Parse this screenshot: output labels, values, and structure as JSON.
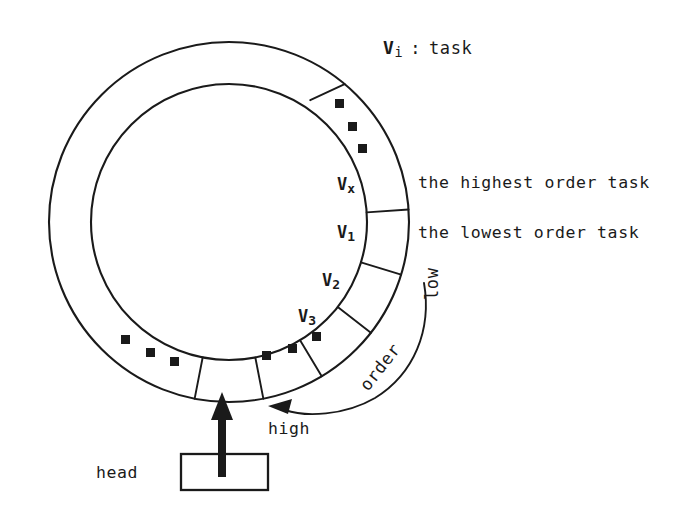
{
  "diagram": {
    "title_legend": {
      "symbol": "V",
      "subscript": "i",
      "separator": ":",
      "meaning": "task",
      "full": "Vi : task"
    },
    "ring": {
      "center_x": 229,
      "center_y": 222,
      "outer_radius": 180,
      "inner_radius": 138,
      "segments": [
        {
          "id": "vx",
          "label_main": "V",
          "label_sub": "x",
          "full": "Vx",
          "note": "the highest order task"
        },
        {
          "id": "v1",
          "label_main": "V",
          "label_sub": "1",
          "full": "V1",
          "note": "the lowest order task"
        },
        {
          "id": "v2",
          "label_main": "V",
          "label_sub": "2",
          "full": "V2",
          "note": ""
        },
        {
          "id": "v3",
          "label_main": "V",
          "label_sub": "3",
          "full": "V3",
          "note": ""
        },
        {
          "id": "empty-head-slot",
          "label_main": "",
          "label_sub": "",
          "full": "",
          "note": ""
        }
      ],
      "ellipsis_groups": 3
    },
    "annotations": {
      "highest_order": "the highest order task",
      "lowest_order": "the lowest order task",
      "order_label": "order",
      "low_label": "low",
      "high_label": "high",
      "head_label": "head"
    },
    "colors": {
      "ink": "#1a1a1a",
      "paper": "#ffffff"
    }
  }
}
